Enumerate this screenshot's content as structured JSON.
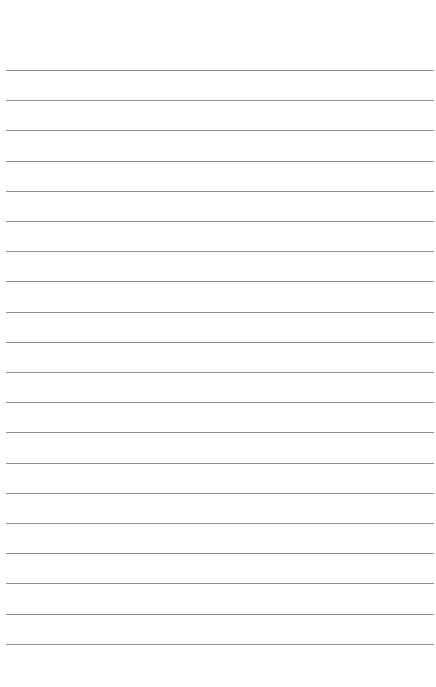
{
  "page": {
    "type": "ruled-paper",
    "background_color": "#ffffff",
    "line_color": "#8e8e8e",
    "line_count": 20,
    "first_line_y": 70,
    "line_spacing": 30.2,
    "line_left": 6,
    "line_right": 434
  }
}
